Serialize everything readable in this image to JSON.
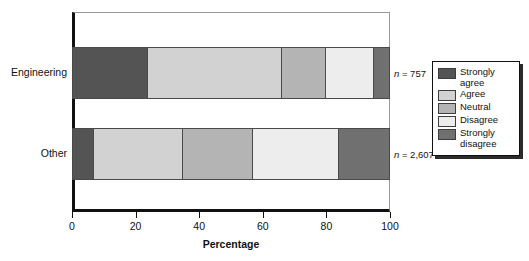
{
  "chart_data": {
    "type": "bar",
    "orientation": "horizontal",
    "stacked": true,
    "normalized": true,
    "title": "",
    "xlabel": "Percentage",
    "ylabel": "",
    "xlim": [
      0,
      100
    ],
    "xticks": [
      0,
      20,
      40,
      60,
      80,
      100
    ],
    "xticklabels": [
      "0",
      "20",
      "40",
      "60",
      "80",
      "100"
    ],
    "grid": false,
    "legend_position": "right-outside",
    "categories": [
      "Engineering",
      "Other"
    ],
    "series": [
      {
        "name": "Strongly agree",
        "color": "#545454",
        "values": [
          24,
          7
        ]
      },
      {
        "name": "Agree",
        "color": "#d2d2d2",
        "values": [
          42,
          28
        ]
      },
      {
        "name": "Neutral",
        "color": "#b4b4b4",
        "values": [
          14,
          22
        ]
      },
      {
        "name": "Disagree",
        "color": "#ededed",
        "values": [
          15,
          27
        ]
      },
      {
        "name": "Strongly disagree",
        "color": "#707070",
        "values": [
          5,
          16
        ]
      }
    ],
    "annotations": [
      {
        "category": "Engineering",
        "text": "n = 757",
        "n_prefix": "n",
        "n_value": "= 757"
      },
      {
        "category": "Other",
        "text": "n = 2,607",
        "n_prefix": "n",
        "n_value": "= 2,607"
      }
    ]
  },
  "legend": {
    "items": [
      {
        "label": "Strongly agree",
        "color": "#545454"
      },
      {
        "label": "Agree",
        "color": "#d2d2d2"
      },
      {
        "label": "Neutral",
        "color": "#b4b4b4"
      },
      {
        "label": "Disagree",
        "color": "#ededed"
      },
      {
        "label": "Strongly disagree",
        "color": "#707070"
      }
    ]
  },
  "axis": {
    "x_title": "Percentage",
    "tick_labels": [
      "0",
      "20",
      "40",
      "60",
      "80",
      "100"
    ]
  },
  "categories": {
    "engineering_label": "Engineering",
    "other_label": "Other"
  },
  "annotations": {
    "engineering_n_italic": "n",
    "engineering_n_rest": " = 757",
    "other_n_italic": "n",
    "other_n_rest": " = 2,607"
  }
}
